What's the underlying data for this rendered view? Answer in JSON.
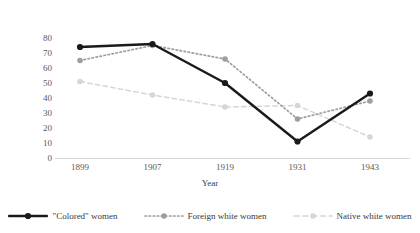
{
  "chart_data": {
    "type": "line",
    "title": "",
    "xlabel": "Year",
    "ylabel": "Percentage of working population in domestic service",
    "categories": [
      "1899",
      "1907",
      "1919",
      "1931",
      "1943"
    ],
    "ylim": [
      0,
      80
    ],
    "ytick_labels": [
      "0",
      "10",
      "20",
      "30",
      "40",
      "50",
      "60",
      "70",
      "80"
    ],
    "ytick_values": [
      0,
      10,
      20,
      30,
      40,
      50,
      60,
      70,
      80
    ],
    "grid": false,
    "legend_position": "bottom",
    "series": [
      {
        "name": "\"Colored\" women",
        "values": [
          74,
          76,
          50,
          11,
          43
        ],
        "color": "#1a1a1a",
        "style": "solid",
        "marker": "circle"
      },
      {
        "name": "Foreign white women",
        "values": [
          65,
          75,
          66,
          26,
          38
        ],
        "color": "#9e9e9e",
        "style": "dotted",
        "marker": "circle"
      },
      {
        "name": "Native white women",
        "values": [
          51,
          42,
          34,
          35,
          14
        ],
        "color": "#d6d6d6",
        "style": "dashed",
        "marker": "circle"
      }
    ]
  },
  "axis": {
    "x_axis_name": "year-axis",
    "y_axis_name": "percentage-axis"
  }
}
